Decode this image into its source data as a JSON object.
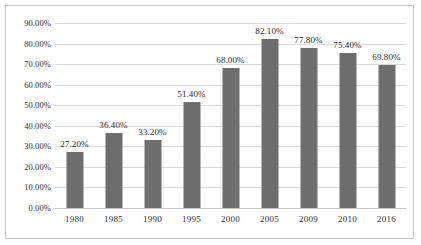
{
  "chart_data": {
    "type": "bar",
    "title": "",
    "subtitle": "",
    "xlabel": "",
    "ylabel": "",
    "categories": [
      "1980",
      "1985",
      "1990",
      "1995",
      "2000",
      "2005",
      "2009",
      "2010",
      "2016"
    ],
    "values": [
      27.2,
      36.4,
      33.2,
      51.4,
      68.0,
      82.1,
      77.8,
      75.4,
      69.8
    ],
    "data_labels": [
      "27.20%",
      "36.40%",
      "33.20%",
      "51.40%",
      "68.00%",
      "82.10%",
      "77.80%",
      "75.40%",
      "69.80%"
    ],
    "ylim": [
      0,
      90
    ],
    "ytick_values": [
      0,
      10,
      20,
      30,
      40,
      50,
      60,
      70,
      80,
      90
    ],
    "ytick_labels": [
      "0.00%",
      "10.00%",
      "20.00%",
      "30.00%",
      "40.00%",
      "50.00%",
      "60.00%",
      "70.00%",
      "80.00%",
      "90.00%"
    ],
    "grid": "horizontal",
    "legend": "none",
    "series": [
      {
        "name": "",
        "values": [
          27.2,
          36.4,
          33.2,
          51.4,
          68.0,
          82.1,
          77.8,
          75.4,
          69.8
        ]
      }
    ],
    "colors": {
      "bar_fill": "#6e6e6e",
      "gridline": "#dadada",
      "axis_line": "#c4c4c4",
      "border": "#c9c9c9",
      "background": "#ffffff",
      "text": "#2f2f2f"
    }
  }
}
